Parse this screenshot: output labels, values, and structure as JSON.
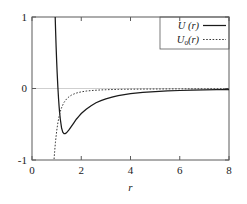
{
  "chart_data": {
    "type": "line",
    "title": "",
    "xlabel": "r",
    "ylabel": "",
    "xlim": [
      0,
      8
    ],
    "ylim": [
      -1,
      1
    ],
    "xticks": [
      0,
      2,
      4,
      6,
      8
    ],
    "xtick_labels": [
      "0",
      "2",
      "4",
      "6",
      "8"
    ],
    "yticks": [
      -1,
      0,
      1
    ],
    "ytick_labels": [
      "-1",
      "0",
      "1"
    ],
    "grid": true,
    "gridlines_y": [
      0
    ],
    "legend_position": "top-right",
    "series": [
      {
        "name": "U (r)",
        "label_main": "U (r)",
        "label_base": "U",
        "label_sub": "",
        "label_arg": "(r)",
        "style": "solid",
        "color": "#1a1a1a",
        "x": [
          0.9,
          0.92,
          0.94,
          0.96,
          0.98,
          1.0,
          1.02,
          1.05,
          1.08,
          1.1,
          1.12,
          1.15,
          1.2,
          1.25,
          1.3,
          1.35,
          1.4,
          1.5,
          1.6,
          1.7,
          1.8,
          1.9,
          2.0,
          2.2,
          2.4,
          2.6,
          2.8,
          3.0,
          3.25,
          3.5,
          3.75,
          4.0,
          4.5,
          5.0,
          5.5,
          6.0,
          6.5,
          7.0,
          7.5,
          8.0
        ],
        "y": [
          1.55,
          1.28,
          1.02,
          0.79,
          0.58,
          0.39,
          0.23,
          0.02,
          -0.15,
          -0.25,
          -0.33,
          -0.43,
          -0.55,
          -0.61,
          -0.63,
          -0.63,
          -0.62,
          -0.58,
          -0.53,
          -0.48,
          -0.43,
          -0.39,
          -0.35,
          -0.29,
          -0.24,
          -0.2,
          -0.17,
          -0.145,
          -0.12,
          -0.1,
          -0.085,
          -0.072,
          -0.055,
          -0.043,
          -0.034,
          -0.028,
          -0.023,
          -0.019,
          -0.016,
          -0.014
        ]
      },
      {
        "name": "U0(r)",
        "label_main": "U0(r)",
        "label_base": "U",
        "label_sub": "0",
        "label_arg": "(r)",
        "style": "dotted",
        "color": "#3a3a3a",
        "x": [
          0.84,
          0.86,
          0.88,
          0.9,
          0.92,
          0.95,
          1.0,
          1.05,
          1.1,
          1.15,
          1.2,
          1.25,
          1.3,
          1.4,
          1.5,
          1.6,
          1.7,
          1.8,
          1.9,
          2.0,
          2.2,
          2.4,
          2.6,
          2.8,
          3.0,
          3.25,
          3.5,
          3.75,
          4.0,
          4.5,
          5.0,
          5.5,
          6.0,
          6.5,
          7.0,
          7.5,
          8.0
        ],
        "y": [
          -1.3,
          -1.18,
          -1.07,
          -0.97,
          -0.88,
          -0.76,
          -0.6,
          -0.48,
          -0.39,
          -0.32,
          -0.27,
          -0.23,
          -0.195,
          -0.148,
          -0.116,
          -0.093,
          -0.077,
          -0.064,
          -0.055,
          -0.047,
          -0.036,
          -0.029,
          -0.024,
          -0.02,
          -0.017,
          -0.0145,
          -0.0125,
          -0.011,
          -0.0098,
          -0.008,
          -0.0068,
          -0.0058,
          -0.0051,
          -0.0045,
          -0.004,
          -0.0036,
          -0.0033
        ]
      }
    ]
  },
  "figure": {
    "background_color": "#ffffff",
    "frame_color": "#555555",
    "zero_line_color": "#cccccc"
  }
}
